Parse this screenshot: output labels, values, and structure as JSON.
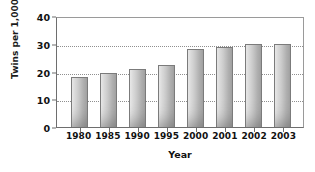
{
  "chart_data": {
    "type": "bar",
    "title": "",
    "xlabel": "Year",
    "ylabel": "Twins per 1,000 births",
    "categories": [
      "1980",
      "1985",
      "1990",
      "1995",
      "2000",
      "2001",
      "2002",
      "2003"
    ],
    "values": [
      18,
      19.5,
      21,
      22.5,
      28,
      29,
      30,
      30
    ],
    "ylim": [
      0,
      40
    ],
    "yticks": [
      "0",
      "10",
      "20",
      "30",
      "40"
    ],
    "ytick_values": [
      0,
      10,
      20,
      30,
      40
    ],
    "grid": "horizontal-dotted",
    "legend": "none",
    "series": [
      {
        "name": "Twins per 1,000 births",
        "values": [
          18,
          19.5,
          21,
          22.5,
          28,
          29,
          30,
          30
        ]
      }
    ],
    "colors": {
      "bar_light": "#e9e9e9",
      "bar_dark": "#a2a2a2",
      "bar_border": "#7b7b7b",
      "axis": "#6e6e6e",
      "grid": "#8f8f8f",
      "text": "#111111",
      "background": "#ffffff"
    }
  }
}
